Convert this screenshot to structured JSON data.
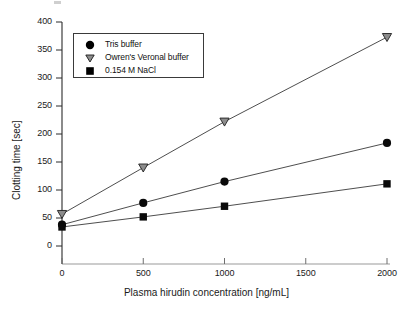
{
  "chart_data": {
    "type": "line",
    "title": "",
    "xlabel": "Plasma hirudin concentration [ng/mL]",
    "ylabel": "Clotting time  [sec]",
    "x": [
      0,
      500,
      1000,
      2000
    ],
    "xlim": [
      0,
      2000
    ],
    "ylim": [
      0,
      400
    ],
    "xticks": [
      "0",
      "500",
      "1000",
      "1500",
      "2000"
    ],
    "xtick_values": [
      0,
      500,
      1000,
      1500,
      2000
    ],
    "yticks": [
      "0",
      "50",
      "100",
      "150",
      "200",
      "250",
      "300",
      "350",
      "400"
    ],
    "ytick_values": [
      0,
      50,
      100,
      150,
      200,
      250,
      300,
      350,
      400
    ],
    "grid": false,
    "legend_position": "upper-left-inside",
    "series": [
      {
        "name": "Tris buffer",
        "marker": "filled-circle",
        "color": "#000000",
        "values": [
          38,
          77,
          115,
          184
        ]
      },
      {
        "name": "Owren's Veronal buffer",
        "marker": "down-triangle",
        "color": "#808080",
        "values": [
          57,
          140,
          222,
          373
        ]
      },
      {
        "name": "0.154 M NaCl",
        "marker": "filled-square",
        "color": "#000000",
        "values": [
          34,
          52,
          71,
          111
        ]
      }
    ]
  },
  "legend": {
    "items": [
      {
        "label": "Tris buffer",
        "marker": "circle-marker-icon"
      },
      {
        "label": "Owren's Veronal buffer",
        "marker": "triangle-marker-icon"
      },
      {
        "label": "0.154 M NaCl",
        "marker": "square-marker-icon"
      }
    ]
  },
  "axes": {
    "y_title": "Clotting time  [sec]",
    "x_title": "Plasma hirudin concentration [ng/mL]",
    "y_labels": [
      "400",
      "350",
      "300",
      "250",
      "200",
      "150",
      "100",
      "50",
      "0"
    ],
    "x_labels": [
      "0",
      "500",
      "1000",
      "1500",
      "2000"
    ]
  }
}
